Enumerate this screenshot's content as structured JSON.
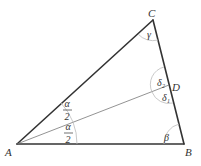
{
  "diagram": {
    "type": "triangle-angle-bisector",
    "vertices": {
      "A": {
        "label": "A",
        "x": 17,
        "y": 144
      },
      "B": {
        "label": "B",
        "x": 184,
        "y": 144
      },
      "C": {
        "label": "C",
        "x": 153,
        "y": 20
      },
      "D": {
        "label": "D",
        "x": 169,
        "y": 85
      }
    },
    "angle_labels": {
      "gamma": "γ",
      "beta": "β",
      "delta1": "δ",
      "delta1_sub": "1",
      "delta2": "δ",
      "delta2_sub": "2",
      "alpha_half_num": "α",
      "alpha_half_den": "2"
    },
    "segments": [
      {
        "from": "A",
        "to": "B",
        "style": "thick"
      },
      {
        "from": "B",
        "to": "C",
        "style": "thick"
      },
      {
        "from": "C",
        "to": "A",
        "style": "thick"
      },
      {
        "from": "A",
        "to": "D",
        "style": "thin"
      }
    ],
    "colors": {
      "edge": "#333333",
      "bisector": "#777777",
      "arc": "#bbbbbb"
    }
  }
}
